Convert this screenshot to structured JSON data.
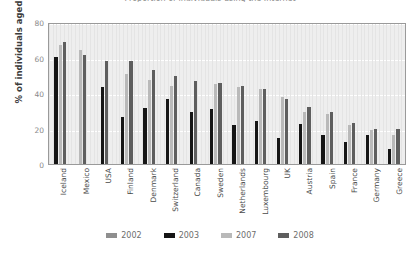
{
  "chart_data": {
    "type": "bar",
    "title": "Proportion of individuals using the Internet",
    "xlabel": "",
    "ylabel": "% of individuals aged (16-74)",
    "ylim": [
      0,
      80
    ],
    "yticks": [
      0,
      20,
      40,
      60,
      80
    ],
    "grid": true,
    "legend_position": "bottom",
    "categories": [
      "Iceland",
      "Mexico",
      "USA",
      "Finland",
      "Denmark",
      "Switzerland",
      "Canada",
      "Sweden",
      "Netherlands",
      "Luxembourg",
      "UK",
      "Austria",
      "Spain",
      "France",
      "Germany",
      "Greece"
    ],
    "series": [
      {
        "name": "2002",
        "color": "#8f8f8f",
        "values": [
          null,
          null,
          null,
          null,
          null,
          null,
          null,
          null,
          null,
          null,
          null,
          null,
          null,
          null,
          null,
          null
        ]
      },
      {
        "name": "2003",
        "color": "#151515",
        "values": [
          60.5,
          null,
          43.5,
          26.5,
          31.5,
          36.5,
          29.5,
          31.0,
          22.0,
          24.0,
          14.5,
          22.5,
          16.5,
          12.5,
          16.5,
          8.5
        ]
      },
      {
        "name": "2007",
        "color": "#b9b9b9",
        "values": [
          67.0,
          64.0,
          null,
          50.5,
          47.5,
          44.0,
          null,
          45.0,
          43.5,
          42.0,
          38.0,
          29.5,
          28.0,
          22.0,
          19.0,
          16.5
        ]
      },
      {
        "name": "2008",
        "color": "#5e5e5e",
        "values": [
          69.0,
          61.5,
          58.0,
          58.0,
          53.0,
          49.5,
          46.5,
          45.5,
          44.0,
          42.5,
          36.5,
          32.0,
          29.5,
          23.0,
          20.0,
          19.5
        ]
      }
    ]
  },
  "legend": {
    "items": [
      {
        "label": "2002",
        "color": "#8f8f8f"
      },
      {
        "label": "2003",
        "color": "#151515"
      },
      {
        "label": "2007",
        "color": "#b9b9b9"
      },
      {
        "label": "2008",
        "color": "#5e5e5e"
      }
    ]
  }
}
